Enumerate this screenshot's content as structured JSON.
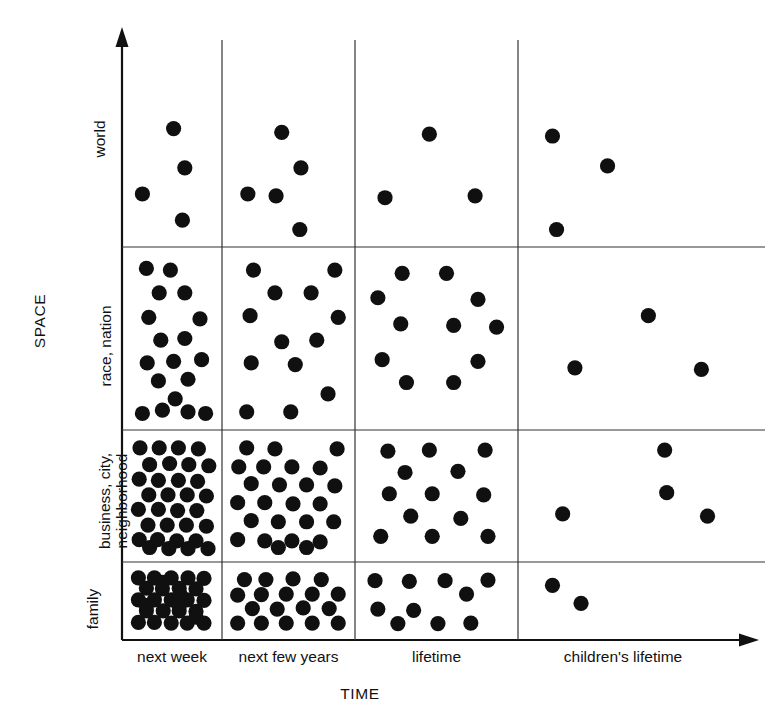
{
  "figure": {
    "axis_titles": {
      "y": "SPACE",
      "x": "TIME"
    },
    "y_categories": [
      "world",
      "race, nation",
      "business, city,",
      "neighborhood",
      "family"
    ],
    "x_categories": [
      "next week",
      "next few years",
      "lifetime",
      "children's lifetime"
    ],
    "colors": {
      "ink": "#111111",
      "dot": "#101010",
      "grid": "#333333",
      "background": "#ffffff"
    }
  },
  "chart_data": {
    "type": "scatter",
    "title": "",
    "xlabel": "TIME",
    "ylabel": "SPACE",
    "grid": true,
    "legend": "none",
    "columns": [
      "next week",
      "next few years",
      "lifetime",
      "children's lifetime"
    ],
    "rows": [
      "world",
      "race, nation",
      "business, city, neighborhood",
      "family"
    ],
    "counts": [
      [
        4,
        5,
        3,
        3
      ],
      [
        17,
        12,
        11,
        3
      ],
      [
        32,
        25,
        15,
        4
      ],
      [
        28,
        21,
        12,
        2
      ]
    ],
    "points": {
      "world": {
        "next week": [
          [
            0.52,
            0.42
          ],
          [
            0.66,
            0.63
          ],
          [
            0.13,
            0.77
          ],
          [
            0.63,
            0.91
          ]
        ],
        "next few years": [
          [
            0.44,
            0.44
          ],
          [
            0.61,
            0.63
          ],
          [
            0.14,
            0.77
          ],
          [
            0.39,
            0.78
          ],
          [
            0.6,
            0.96
          ]
        ],
        "lifetime": [
          [
            0.45,
            0.45
          ],
          [
            0.14,
            0.79
          ],
          [
            0.77,
            0.78
          ]
        ],
        "children's lifetime": [
          [
            0.12,
            0.46
          ],
          [
            0.39,
            0.62
          ],
          [
            0.14,
            0.96
          ]
        ]
      },
      "race, nation": {
        "next week": [
          [
            0.18,
            0.07
          ],
          [
            0.48,
            0.08
          ],
          [
            0.34,
            0.22
          ],
          [
            0.66,
            0.22
          ],
          [
            0.21,
            0.37
          ],
          [
            0.85,
            0.38
          ],
          [
            0.36,
            0.51
          ],
          [
            0.66,
            0.5
          ],
          [
            0.19,
            0.65
          ],
          [
            0.52,
            0.64
          ],
          [
            0.87,
            0.63
          ],
          [
            0.33,
            0.76
          ],
          [
            0.7,
            0.75
          ],
          [
            0.54,
            0.87
          ],
          [
            0.13,
            0.96
          ],
          [
            0.38,
            0.94
          ],
          [
            0.7,
            0.95
          ],
          [
            0.92,
            0.96
          ]
        ],
        "next few years": [
          [
            0.19,
            0.08
          ],
          [
            0.91,
            0.08
          ],
          [
            0.38,
            0.22
          ],
          [
            0.7,
            0.22
          ],
          [
            0.16,
            0.36
          ],
          [
            0.94,
            0.37
          ],
          [
            0.44,
            0.52
          ],
          [
            0.75,
            0.51
          ],
          [
            0.17,
            0.65
          ],
          [
            0.56,
            0.66
          ],
          [
            0.85,
            0.84
          ],
          [
            0.13,
            0.95
          ],
          [
            0.52,
            0.95
          ]
        ],
        "lifetime": [
          [
            0.26,
            0.1
          ],
          [
            0.57,
            0.1
          ],
          [
            0.09,
            0.25
          ],
          [
            0.79,
            0.26
          ],
          [
            0.25,
            0.41
          ],
          [
            0.62,
            0.42
          ],
          [
            0.92,
            0.43
          ],
          [
            0.12,
            0.63
          ],
          [
            0.79,
            0.64
          ],
          [
            0.29,
            0.77
          ],
          [
            0.62,
            0.77
          ]
        ],
        "children's lifetime": [
          [
            0.59,
            0.36
          ],
          [
            0.23,
            0.68
          ],
          [
            0.85,
            0.69
          ]
        ]
      },
      "business, city, neighborhood": {
        "next week": [
          [
            0.1,
            0.07
          ],
          [
            0.34,
            0.07
          ],
          [
            0.58,
            0.07
          ],
          [
            0.83,
            0.08
          ],
          [
            0.22,
            0.22
          ],
          [
            0.47,
            0.21
          ],
          [
            0.71,
            0.22
          ],
          [
            0.96,
            0.23
          ],
          [
            0.09,
            0.35
          ],
          [
            0.33,
            0.36
          ],
          [
            0.58,
            0.36
          ],
          [
            0.82,
            0.37
          ],
          [
            0.21,
            0.49
          ],
          [
            0.45,
            0.49
          ],
          [
            0.69,
            0.49
          ],
          [
            0.93,
            0.5
          ],
          [
            0.08,
            0.62
          ],
          [
            0.33,
            0.62
          ],
          [
            0.57,
            0.63
          ],
          [
            0.81,
            0.63
          ],
          [
            0.2,
            0.76
          ],
          [
            0.44,
            0.76
          ],
          [
            0.68,
            0.76
          ],
          [
            0.93,
            0.77
          ],
          [
            0.09,
            0.89
          ],
          [
            0.32,
            0.89
          ],
          [
            0.56,
            0.9
          ],
          [
            0.8,
            0.9
          ],
          [
            0.22,
            0.96
          ],
          [
            0.46,
            0.97
          ],
          [
            0.7,
            0.97
          ],
          [
            0.95,
            0.97
          ]
        ],
        "next few years": [
          [
            0.13,
            0.07
          ],
          [
            0.38,
            0.08
          ],
          [
            0.93,
            0.08
          ],
          [
            0.06,
            0.24
          ],
          [
            0.28,
            0.24
          ],
          [
            0.53,
            0.24
          ],
          [
            0.78,
            0.25
          ],
          [
            0.17,
            0.39
          ],
          [
            0.42,
            0.4
          ],
          [
            0.66,
            0.4
          ],
          [
            0.91,
            0.41
          ],
          [
            0.05,
            0.56
          ],
          [
            0.29,
            0.56
          ],
          [
            0.54,
            0.57
          ],
          [
            0.78,
            0.57
          ],
          [
            0.17,
            0.72
          ],
          [
            0.41,
            0.73
          ],
          [
            0.66,
            0.73
          ],
          [
            0.9,
            0.73
          ],
          [
            0.05,
            0.89
          ],
          [
            0.29,
            0.9
          ],
          [
            0.53,
            0.9
          ],
          [
            0.78,
            0.91
          ],
          [
            0.41,
            0.96
          ],
          [
            0.66,
            0.96
          ]
        ],
        "lifetime": [
          [
            0.16,
            0.1
          ],
          [
            0.45,
            0.09
          ],
          [
            0.84,
            0.09
          ],
          [
            0.28,
            0.29
          ],
          [
            0.65,
            0.28
          ],
          [
            0.17,
            0.48
          ],
          [
            0.47,
            0.48
          ],
          [
            0.83,
            0.49
          ],
          [
            0.32,
            0.68
          ],
          [
            0.67,
            0.7
          ],
          [
            0.11,
            0.86
          ],
          [
            0.47,
            0.86
          ],
          [
            0.86,
            0.86
          ]
        ],
        "children's lifetime": [
          [
            0.67,
            0.09
          ],
          [
            0.68,
            0.47
          ],
          [
            0.17,
            0.66
          ],
          [
            0.88,
            0.68
          ]
        ]
      },
      "family": {
        "next week": [
          [
            0.08,
            0.1
          ],
          [
            0.28,
            0.1
          ],
          [
            0.49,
            0.1
          ],
          [
            0.7,
            0.1
          ],
          [
            0.9,
            0.11
          ],
          [
            0.18,
            0.28
          ],
          [
            0.38,
            0.29
          ],
          [
            0.59,
            0.28
          ],
          [
            0.8,
            0.29
          ],
          [
            0.08,
            0.48
          ],
          [
            0.28,
            0.48
          ],
          [
            0.49,
            0.48
          ],
          [
            0.69,
            0.48
          ],
          [
            0.9,
            0.49
          ],
          [
            0.18,
            0.67
          ],
          [
            0.39,
            0.67
          ],
          [
            0.59,
            0.67
          ],
          [
            0.8,
            0.68
          ],
          [
            0.08,
            0.87
          ],
          [
            0.28,
            0.87
          ],
          [
            0.49,
            0.88
          ],
          [
            0.69,
            0.88
          ],
          [
            0.9,
            0.88
          ],
          [
            0.38,
            0.18
          ],
          [
            0.6,
            0.38
          ],
          [
            0.18,
            0.58
          ],
          [
            0.59,
            0.58
          ],
          [
            0.8,
            0.78
          ]
        ],
        "next few years": [
          [
            0.11,
            0.13
          ],
          [
            0.3,
            0.13
          ],
          [
            0.54,
            0.12
          ],
          [
            0.79,
            0.13
          ],
          [
            0.05,
            0.4
          ],
          [
            0.26,
            0.39
          ],
          [
            0.48,
            0.38
          ],
          [
            0.71,
            0.38
          ],
          [
            0.94,
            0.38
          ],
          [
            0.18,
            0.63
          ],
          [
            0.4,
            0.64
          ],
          [
            0.63,
            0.62
          ],
          [
            0.86,
            0.63
          ],
          [
            0.05,
            0.88
          ],
          [
            0.26,
            0.88
          ],
          [
            0.48,
            0.88
          ],
          [
            0.71,
            0.88
          ],
          [
            0.94,
            0.88
          ]
        ],
        "lifetime": [
          [
            0.07,
            0.15
          ],
          [
            0.31,
            0.16
          ],
          [
            0.56,
            0.15
          ],
          [
            0.86,
            0.14
          ],
          [
            0.71,
            0.38
          ],
          [
            0.09,
            0.64
          ],
          [
            0.34,
            0.66
          ],
          [
            0.23,
            0.89
          ],
          [
            0.51,
            0.89
          ],
          [
            0.74,
            0.88
          ]
        ],
        "children's lifetime": [
          [
            0.12,
            0.23
          ],
          [
            0.26,
            0.54
          ]
        ]
      }
    }
  }
}
